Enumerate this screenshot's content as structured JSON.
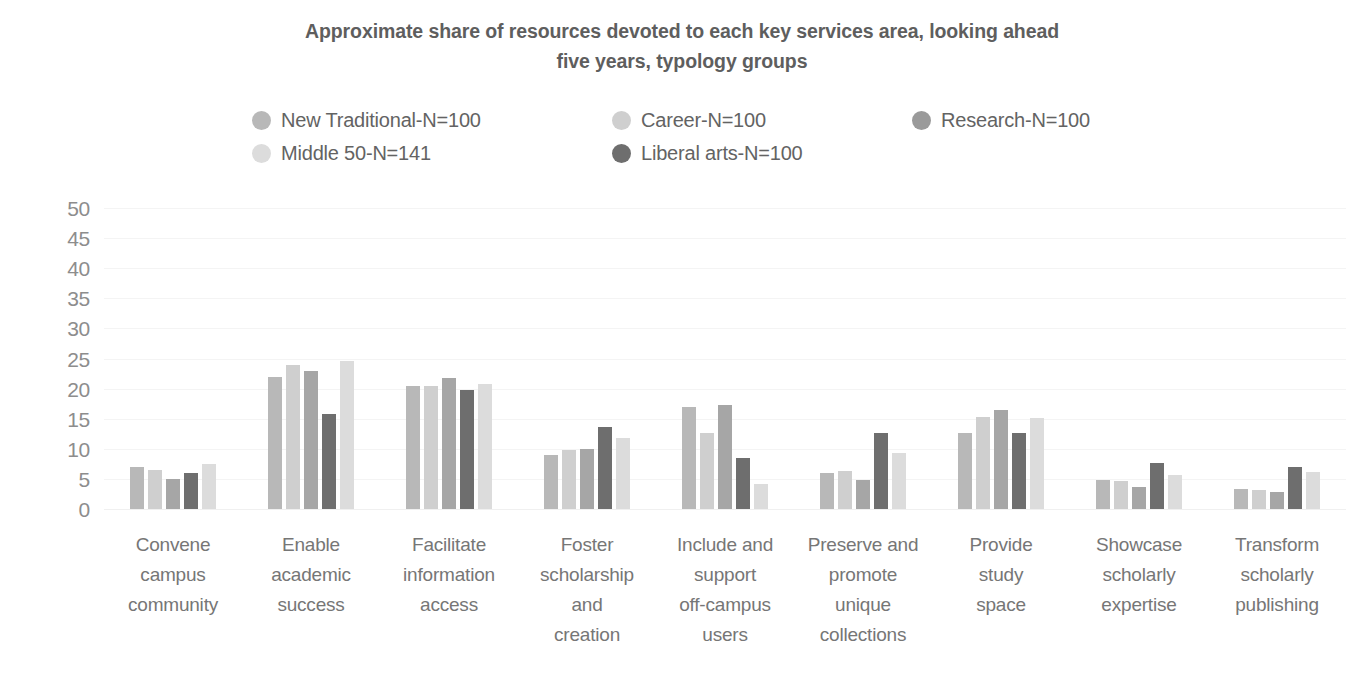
{
  "chart_data": {
    "type": "bar",
    "title": "Approximate share of resources devoted to each key services area, looking ahead five years, typology groups",
    "title_line1": "Approximate share of resources devoted to each key services area, looking ahead",
    "title_line2": "five years, typology groups",
    "xlabel": "",
    "ylabel": "",
    "ylim": [
      0,
      50
    ],
    "yticks": [
      50,
      45,
      40,
      35,
      30,
      25,
      20,
      15,
      10,
      5,
      0
    ],
    "grid": true,
    "legend_position": "top",
    "categories": [
      "Convene campus community",
      "Enable academic success",
      "Facilitate information access",
      "Foster scholarship and creation",
      "Include and support off-campus users",
      "Preserve and promote unique collections",
      "Provide study space",
      "Showcase scholarly expertise",
      "Transform scholarly publishing"
    ],
    "category_lines": [
      [
        "Convene",
        "campus",
        "community"
      ],
      [
        "Enable",
        "academic",
        "success"
      ],
      [
        "Facilitate",
        "information",
        "access"
      ],
      [
        "Foster",
        "scholarship",
        "and",
        "creation"
      ],
      [
        "Include and",
        "support",
        "off-campus",
        "users"
      ],
      [
        "Preserve and",
        "promote",
        "unique",
        "collections"
      ],
      [
        "Provide",
        "study",
        "space"
      ],
      [
        "Showcase",
        "scholarly",
        "expertise"
      ],
      [
        "Transform",
        "scholarly",
        "publishing"
      ]
    ],
    "series": [
      {
        "name": "New Traditional-N=100",
        "color": "#b8b8b8",
        "values": [
          7.0,
          21.9,
          20.5,
          9.0,
          17.0,
          5.9,
          12.7,
          4.9,
          3.4
        ]
      },
      {
        "name": "Career-N=100",
        "color": "#cfcfcf",
        "values": [
          6.5,
          24.0,
          20.5,
          9.8,
          12.7,
          6.3,
          15.3,
          4.6,
          3.2
        ]
      },
      {
        "name": "Research-N=100",
        "color": "#a6a6a6",
        "values": [
          5.0,
          23.0,
          21.7,
          10.0,
          17.3,
          4.8,
          16.5,
          3.7,
          2.9
        ]
      },
      {
        "name": "Middle 50-N=141",
        "color": "#dcdcdc",
        "values": [
          7.5,
          24.6,
          20.7,
          11.8,
          4.2,
          9.3,
          15.2,
          5.7,
          6.2
        ]
      },
      {
        "name": "Liberal arts-N=100",
        "color": "#6e6e6e",
        "values": [
          6.0,
          15.8,
          19.8,
          13.6,
          8.5,
          12.7,
          12.7,
          7.7,
          7.0
        ]
      }
    ],
    "legend_order": [
      "New Traditional-N=100",
      "Career-N=100",
      "Research-N=100",
      "Middle 50-N=141",
      "Liberal arts-N=100"
    ],
    "legend_colors": {
      "New Traditional-N=100": "#b8b8b8",
      "Career-N=100": "#cfcfcf",
      "Research-N=100": "#9a9a9a",
      "Middle 50-N=141": "#dcdcdc",
      "Liberal arts-N=100": "#6e6e6e"
    },
    "bar_draw_order": [
      "New Traditional-N=100",
      "Career-N=100",
      "Research-N=100",
      "Liberal arts-N=100",
      "Middle 50-N=141"
    ]
  }
}
